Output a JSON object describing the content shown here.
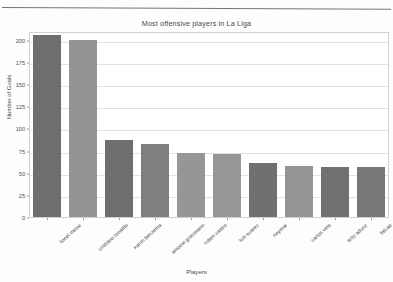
{
  "page": {
    "rule_color": "#5d5d5d"
  },
  "chart_data": {
    "type": "bar",
    "title": "Most offensive players in La Liga",
    "xlabel": "Players",
    "ylabel": "Number of Goals",
    "categories": [
      "lionel messi",
      "cristiano ronaldo",
      "karim benzema",
      "antoine griezmann",
      "ruben castro",
      "luis suarez",
      "neymar",
      "carlos vela",
      "aritz aduriz",
      "falcao"
    ],
    "values": [
      206,
      200,
      87,
      82,
      72,
      71,
      61,
      58,
      56,
      56
    ],
    "bar_colors": [
      "#6e6e6e",
      "#949494",
      "#6e6e6e",
      "#7f7f7f",
      "#969696",
      "#979797",
      "#707070",
      "#959595",
      "#717171",
      "#787878"
    ],
    "ylim": [
      0,
      210
    ],
    "yticks": [
      0,
      25,
      50,
      75,
      100,
      125,
      150,
      175,
      200
    ],
    "ytick_labels": [
      "0",
      "25",
      "50",
      "75",
      "100",
      "125",
      "150",
      "175",
      "200"
    ],
    "grid": true,
    "legend": false,
    "plot_bg": "#ffffff",
    "grid_color": "#e2e2e2",
    "frame_color": "#d0d0d0"
  }
}
